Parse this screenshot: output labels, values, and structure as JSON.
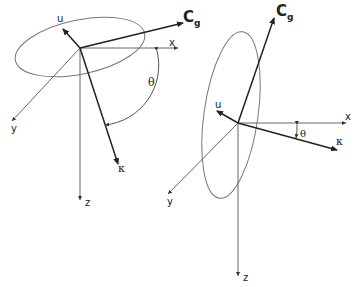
{
  "diagram": {
    "left_figure": {
      "labels": {
        "u": "u",
        "cg_main": "C",
        "cg_sub": "g",
        "x": "x",
        "y": "y",
        "z": "z",
        "kappa": "κ",
        "theta": "θ"
      }
    },
    "right_figure": {
      "labels": {
        "u": "u",
        "cg_main": "C",
        "cg_sub": "g",
        "x": "x",
        "y": "y",
        "z": "z",
        "kappa": "κ",
        "theta": "θ"
      }
    },
    "colors": {
      "axis": "#555555",
      "vector": "#222222",
      "ellipse": "#777777"
    }
  }
}
